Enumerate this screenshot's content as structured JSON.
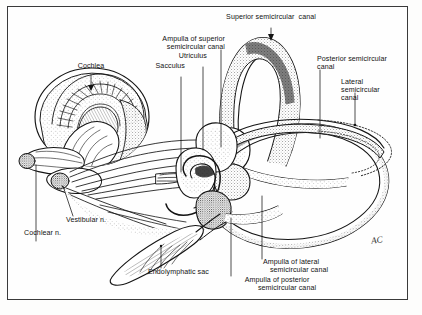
{
  "figure": {
    "border_color": "#3a3a3a",
    "ink_color": "#121212",
    "background_color": "#fefefe",
    "signature": "AC"
  },
  "labels": {
    "cochlea": "Cochlea",
    "ampulla_superior_l1": "Ampulla of superior",
    "ampulla_superior_l2": "semicircular canal",
    "utriculus": "Utriculus",
    "sacculus": "Sacculus",
    "superior_canal": "Superior semicircular  canal",
    "posterior_canal_l1": "Posterior semicircular",
    "posterior_canal_l2": "canal",
    "lateral_canal_l1": "Lateral",
    "lateral_canal_l2": "semicircular",
    "lateral_canal_l3": "canal",
    "vestibular_n": "Vestibular n.",
    "cochlear_n": "Cochlear n.",
    "endolymphatic_sac": "Endolymphatic sac",
    "ampulla_lateral_l1": "Ampulla of lateral",
    "ampulla_lateral_l2": "semicircular canal",
    "ampulla_posterior_l1": "Ampulla of posterior",
    "ampulla_posterior_l2": "semicircular canal"
  }
}
